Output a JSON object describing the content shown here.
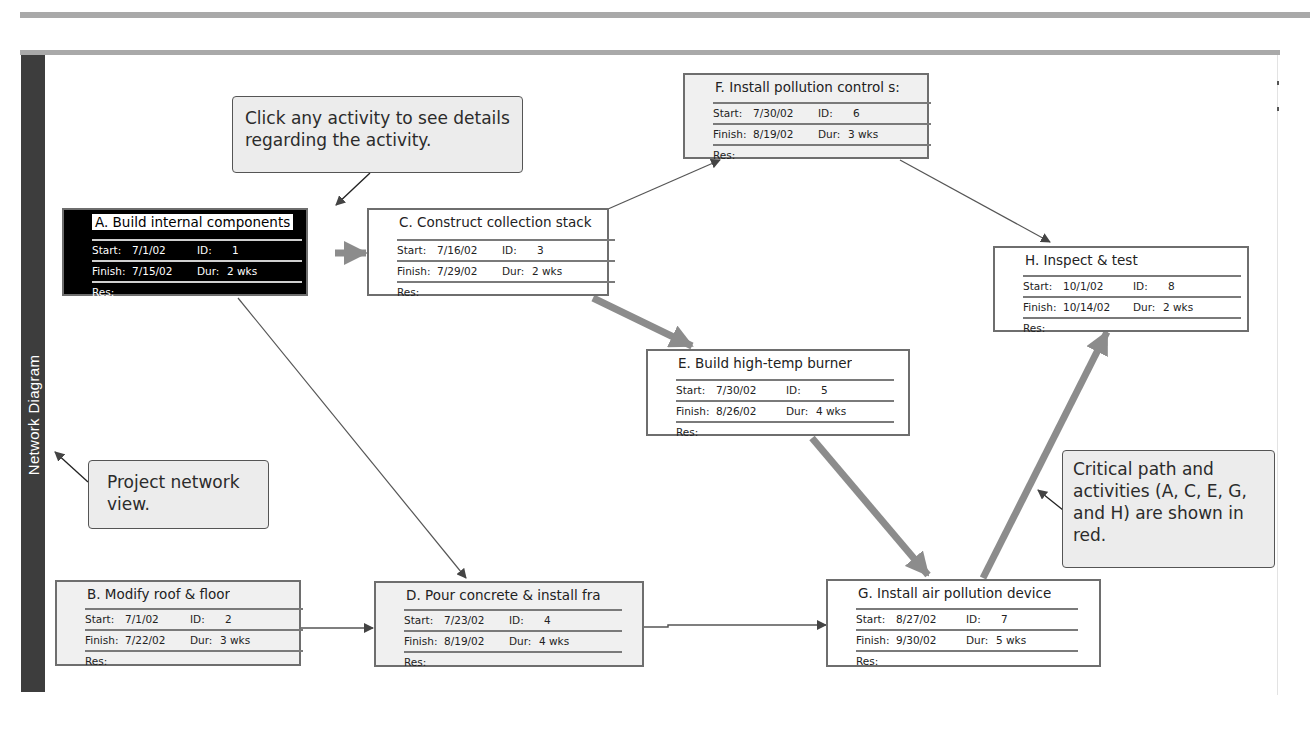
{
  "view": {
    "sidebar_label": "Network Diagram"
  },
  "colors": {
    "critical_path": "#8c8c8c",
    "non_critical_path": "#555555",
    "node_border": "#6e6e6e",
    "selected_node_bg": "#000000",
    "sidebar_bg": "#3d3d3d"
  },
  "field_labels": {
    "start": "Start:",
    "id": "ID:",
    "finish": "Finish:",
    "dur": "Dur:",
    "res": "Res:"
  },
  "activities": [
    {
      "key": "A",
      "title": "A. Build internal components",
      "start": "7/1/02",
      "id": "1",
      "finish": "7/15/02",
      "dur": "2 wks",
      "res": "",
      "critical": true,
      "selected": true
    },
    {
      "key": "B",
      "title": "B. Modify roof & floor",
      "start": "7/1/02",
      "id": "2",
      "finish": "7/22/02",
      "dur": "3 wks",
      "res": "",
      "critical": false,
      "selected": false
    },
    {
      "key": "C",
      "title": "C. Construct collection stack",
      "start": "7/16/02",
      "id": "3",
      "finish": "7/29/02",
      "dur": "2 wks",
      "res": "",
      "critical": true,
      "selected": false
    },
    {
      "key": "D",
      "title": "D. Pour concrete & install fra",
      "start": "7/23/02",
      "id": "4",
      "finish": "8/19/02",
      "dur": "4 wks",
      "res": "",
      "critical": false,
      "selected": false
    },
    {
      "key": "E",
      "title": "E. Build high-temp burner",
      "start": "7/30/02",
      "id": "5",
      "finish": "8/26/02",
      "dur": "4 wks",
      "res": "",
      "critical": true,
      "selected": false
    },
    {
      "key": "F",
      "title": "F. Install pollution control s:",
      "start": "7/30/02",
      "id": "6",
      "finish": "8/19/02",
      "dur": "3 wks",
      "res": "",
      "critical": false,
      "selected": false
    },
    {
      "key": "G",
      "title": "G. Install air pollution device",
      "start": "8/27/02",
      "id": "7",
      "finish": "9/30/02",
      "dur": "5 wks",
      "res": "",
      "critical": true,
      "selected": false
    },
    {
      "key": "H",
      "title": "H. Inspect & test",
      "start": "10/1/02",
      "id": "8",
      "finish": "10/14/02",
      "dur": "2 wks",
      "res": "",
      "critical": true,
      "selected": false
    }
  ],
  "dependencies": [
    {
      "from": "A",
      "to": "C",
      "critical": true
    },
    {
      "from": "A",
      "to": "D",
      "critical": false
    },
    {
      "from": "B",
      "to": "D",
      "critical": false
    },
    {
      "from": "C",
      "to": "E",
      "critical": true
    },
    {
      "from": "C",
      "to": "F",
      "critical": false
    },
    {
      "from": "D",
      "to": "G",
      "critical": false
    },
    {
      "from": "E",
      "to": "G",
      "critical": true
    },
    {
      "from": "F",
      "to": "H",
      "critical": false
    },
    {
      "from": "G",
      "to": "H",
      "critical": true
    }
  ],
  "callouts": {
    "click_activity": "Click any activity to see details regarding the activity.",
    "network_view": "Project network view.",
    "critical_path": "Critical path and activities (A, C, E, G, and H) are shown in red."
  }
}
